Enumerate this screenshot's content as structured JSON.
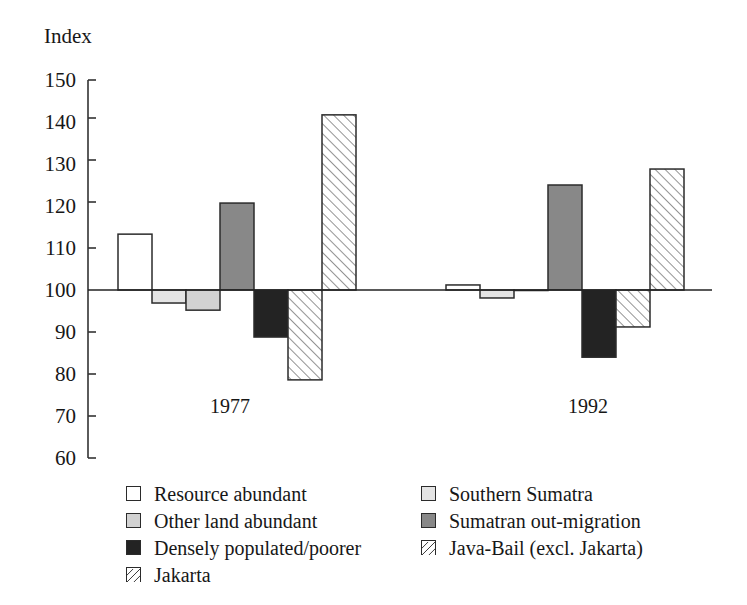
{
  "page": {
    "faint_header": "",
    "background_color": "#ffffff"
  },
  "axis": {
    "y_title": "Index",
    "y_ticks": [
      "150",
      "140",
      "130",
      "120",
      "110",
      "100",
      "90",
      "80",
      "70",
      "60"
    ],
    "x_labels": [
      "1977",
      "1992"
    ]
  },
  "legend": {
    "left_column": [
      {
        "label": "Resource abundant",
        "swatch": "white-square-icon"
      },
      {
        "label": "Other land abundant",
        "swatch": "light-gray-square-icon"
      },
      {
        "label": "Densely populated/poorer",
        "swatch": "black-square-icon"
      },
      {
        "label": "Jakarta",
        "swatch": "hatched-square-icon"
      }
    ],
    "right_column": [
      {
        "label": "Southern Sumatra",
        "swatch": "pale-gray-square-icon"
      },
      {
        "label": "Sumatran out-migration",
        "swatch": "mid-gray-square-icon"
      },
      {
        "label": "Java-Bail (excl. Jakarta)",
        "swatch": "hatched-square-icon"
      }
    ]
  },
  "chart_data": {
    "type": "bar",
    "title": "",
    "xlabel": "",
    "ylabel": "Index",
    "ylim": [
      60,
      150
    ],
    "ytick_step": 10,
    "grid": false,
    "baseline": 100,
    "legend_position": "bottom",
    "categories": [
      "1977",
      "1992"
    ],
    "series": [
      {
        "name": "Resource abundant",
        "fill": "#ffffff",
        "pattern": "solid",
        "values": [
          113.3,
          101.2
        ]
      },
      {
        "name": "Southern Sumatra",
        "fill": "#e4e4e4",
        "pattern": "solid",
        "values": [
          96.9,
          98.1
        ]
      },
      {
        "name": "Other land abundant",
        "fill": "#d2d2d2",
        "pattern": "solid",
        "values": [
          95.2,
          100.0
        ]
      },
      {
        "name": "Sumatran out-migration",
        "fill": "#888888",
        "pattern": "solid",
        "values": [
          120.7,
          125.0
        ]
      },
      {
        "name": "Densely populated/poorer",
        "fill": "#232323",
        "pattern": "solid",
        "values": [
          88.8,
          84.0
        ]
      },
      {
        "name": "Java-Bail (excl. Jakarta)",
        "fill": "#ffffff",
        "pattern": "hatch",
        "values": [
          78.6,
          91.2
        ]
      },
      {
        "name": "Jakarta",
        "fill": "#ffffff",
        "pattern": "hatch",
        "values": [
          141.7,
          128.8
        ]
      }
    ]
  }
}
